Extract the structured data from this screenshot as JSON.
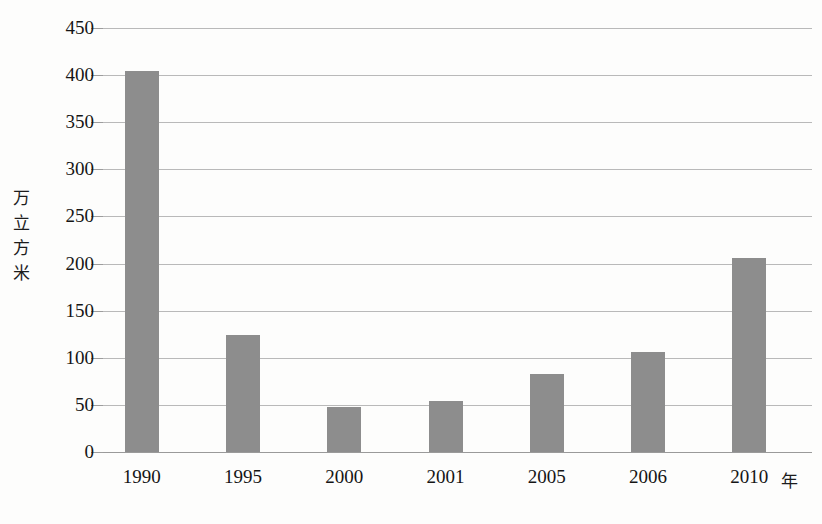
{
  "chart_data": {
    "type": "bar",
    "title": "",
    "xlabel": "年",
    "ylabel": "万立方米",
    "ylabel_chars": [
      "万",
      "立",
      "方",
      "米"
    ],
    "categories": [
      "1990",
      "1995",
      "2000",
      "2001",
      "2005",
      "2006",
      "2010"
    ],
    "values": [
      404,
      124,
      48,
      54,
      83,
      106,
      206
    ],
    "ylim": [
      0,
      450
    ],
    "ytick_step": 50,
    "yticks": [
      0,
      50,
      100,
      150,
      200,
      250,
      300,
      350,
      400,
      450
    ],
    "ytick_labels": [
      "0",
      "50",
      "100",
      "150",
      "200",
      "250",
      "300",
      "350",
      "400",
      "450"
    ],
    "grid": true,
    "grid_axis": "y",
    "legend": false,
    "legend_position": "none",
    "series": [
      {
        "name": "",
        "values": [
          404,
          124,
          48,
          54,
          83,
          106,
          206
        ]
      }
    ]
  },
  "style": {
    "bar_color": "#8d8d8d",
    "grid_color": "#b9b9b9",
    "axis_color": "#9a9a9a",
    "text_color": "#151515",
    "background": "#fdfdfc"
  }
}
